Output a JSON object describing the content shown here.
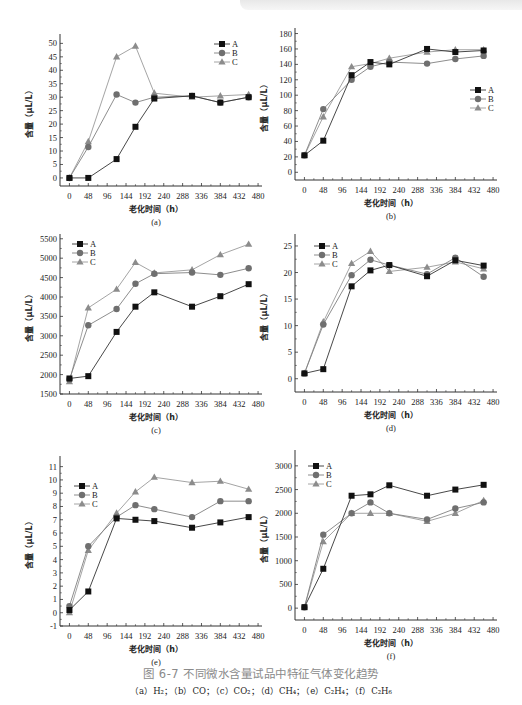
{
  "figure": {
    "title": "图 6-7   不同微水含量试品中特征气体变化趋势",
    "subtitle": "（a）H₂；（b）CO；（c）CO₂；（d）CH₄；（e）C₂H₄；（f）C₂H₆"
  },
  "style": {
    "series_colors": {
      "A": "#111111",
      "B": "#6f6f6f",
      "C": "#8c8c8c"
    },
    "line_colors": {
      "A": "#333333",
      "B": "#808080",
      "C": "#9a9a9a"
    },
    "markers": {
      "A": "square",
      "B": "circle",
      "C": "triangle"
    }
  },
  "chart_data": [
    {
      "id": "a",
      "panel_label": "(a)",
      "type": "line",
      "title": "",
      "xlabel": "老化时间（h）",
      "ylabel": "含量（μL/L）",
      "x": [
        0,
        48,
        120,
        168,
        216,
        312,
        384,
        456
      ],
      "xticks": [
        0,
        48,
        96,
        144,
        192,
        240,
        288,
        336,
        384,
        432,
        480
      ],
      "xlim": [
        -24,
        490
      ],
      "yticks": [
        0,
        5,
        10,
        15,
        20,
        25,
        30,
        35,
        40,
        45,
        50
      ],
      "ylim": [
        -3,
        52
      ],
      "legend_position": "upper-right",
      "series": [
        {
          "name": "A",
          "values": [
            0,
            0,
            7,
            19,
            29.5,
            30.5,
            28,
            30
          ]
        },
        {
          "name": "B",
          "values": [
            0,
            11.5,
            31,
            28,
            30,
            30.5,
            28,
            30
          ]
        },
        {
          "name": "C",
          "values": [
            0,
            13.5,
            45,
            49,
            31.5,
            30,
            30.5,
            31
          ]
        }
      ]
    },
    {
      "id": "b",
      "panel_label": "(b)",
      "type": "line",
      "title": "",
      "xlabel": "老化时间（h）",
      "ylabel": "含量（μL/L）",
      "x": [
        0,
        48,
        120,
        168,
        216,
        312,
        384,
        456
      ],
      "xticks": [
        0,
        48,
        96,
        144,
        192,
        240,
        288,
        336,
        384,
        432,
        480
      ],
      "xlim": [
        -24,
        490
      ],
      "yticks": [
        0,
        20,
        40,
        60,
        80,
        100,
        120,
        140,
        160,
        180
      ],
      "ylim": [
        -10,
        182
      ],
      "legend_position": "right",
      "series": [
        {
          "name": "A",
          "values": [
            22,
            41,
            126,
            143,
            140,
            160,
            156,
            158
          ]
        },
        {
          "name": "B",
          "values": [
            22,
            82,
            120,
            137,
            143,
            141,
            147,
            151
          ]
        },
        {
          "name": "C",
          "values": [
            22,
            72,
            137,
            141,
            148,
            156,
            159,
            159
          ]
        }
      ]
    },
    {
      "id": "c",
      "panel_label": "(c)",
      "type": "line",
      "title": "",
      "xlabel": "老化时间（h）",
      "ylabel": "含量（μL/L）",
      "x": [
        0,
        48,
        120,
        168,
        216,
        312,
        384,
        456
      ],
      "xticks": [
        0,
        48,
        96,
        144,
        192,
        240,
        288,
        336,
        384,
        432,
        480
      ],
      "xlim": [
        -24,
        490
      ],
      "yticks": [
        1500,
        2000,
        2500,
        3000,
        3500,
        4000,
        4500,
        5000,
        5500
      ],
      "ylim": [
        1500,
        5520
      ],
      "legend_position": "upper-left",
      "series": [
        {
          "name": "A",
          "values": [
            1900,
            1960,
            3100,
            3750,
            4120,
            3750,
            4020,
            4330
          ]
        },
        {
          "name": "B",
          "values": [
            1880,
            3270,
            3690,
            4340,
            4600,
            4630,
            4570,
            4740
          ]
        },
        {
          "name": "C",
          "values": [
            1820,
            3720,
            4200,
            4890,
            4620,
            4700,
            5090,
            5360
          ]
        }
      ]
    },
    {
      "id": "d",
      "panel_label": "(d)",
      "type": "line",
      "title": "",
      "xlabel": "老化时间（h）",
      "ylabel": "含量（μL/L）",
      "x": [
        0,
        48,
        120,
        168,
        216,
        312,
        384,
        456
      ],
      "xticks": [
        0,
        48,
        96,
        144,
        192,
        240,
        288,
        336,
        384,
        432,
        480
      ],
      "xlim": [
        -24,
        490
      ],
      "yticks": [
        0,
        5,
        10,
        15,
        20,
        25
      ],
      "ylim": [
        -2.5,
        26.5
      ],
      "legend_position": "upper-left",
      "series": [
        {
          "name": "A",
          "values": [
            1,
            1.8,
            17.4,
            20.4,
            21.4,
            19.3,
            22.3,
            21.3
          ]
        },
        {
          "name": "B",
          "values": [
            1,
            10.2,
            19.5,
            22.4,
            21.4,
            19.7,
            22.8,
            19.2
          ]
        },
        {
          "name": "C",
          "values": [
            1,
            10.7,
            21.7,
            24,
            20.2,
            21,
            22,
            20.7
          ]
        }
      ]
    },
    {
      "id": "e",
      "panel_label": "(e)",
      "type": "line",
      "title": "",
      "xlabel": "老化时间（h）",
      "ylabel": "含量（μL/L）",
      "x": [
        0,
        48,
        120,
        168,
        216,
        312,
        384,
        456
      ],
      "xticks": [
        0,
        48,
        96,
        144,
        192,
        240,
        288,
        336,
        384,
        432,
        480
      ],
      "xlim": [
        -24,
        490
      ],
      "yticks": [
        -1,
        0,
        1,
        2,
        3,
        4,
        5,
        6,
        7,
        8,
        9,
        10,
        11
      ],
      "ylim": [
        -1,
        11.5
      ],
      "legend_position": "upper-left",
      "series": [
        {
          "name": "A",
          "values": [
            0.2,
            1.6,
            7.1,
            7.0,
            6.9,
            6.4,
            6.8,
            7.2
          ]
        },
        {
          "name": "B",
          "values": [
            0.5,
            5.0,
            7.2,
            8.1,
            7.8,
            7.2,
            8.4,
            8.4
          ]
        },
        {
          "name": "C",
          "values": [
            0.0,
            4.7,
            7.5,
            9.1,
            10.2,
            9.8,
            9.9,
            9.3
          ]
        }
      ]
    },
    {
      "id": "f",
      "panel_label": "(f)",
      "type": "line",
      "title": "",
      "xlabel": "老化时间（h）",
      "ylabel": "含量（μL/L）",
      "x": [
        0,
        48,
        120,
        168,
        216,
        312,
        384,
        456
      ],
      "xticks": [
        0,
        48,
        96,
        144,
        192,
        240,
        288,
        336,
        384,
        432,
        480
      ],
      "xlim": [
        -24,
        490
      ],
      "yticks": [
        0,
        500,
        1000,
        1500,
        2000,
        2500,
        3000
      ],
      "ylim": [
        -250,
        3250
      ],
      "legend_position": "upper-left",
      "series": [
        {
          "name": "A",
          "values": [
            20,
            830,
            2370,
            2400,
            2590,
            2370,
            2500,
            2600
          ]
        },
        {
          "name": "B",
          "values": [
            20,
            1550,
            2000,
            2230,
            2000,
            1870,
            2100,
            2230
          ]
        },
        {
          "name": "C",
          "values": [
            20,
            1400,
            2000,
            2000,
            2000,
            1830,
            2000,
            2270
          ]
        }
      ]
    }
  ],
  "layout": [
    {
      "id": "a",
      "left": 22,
      "top": 30,
      "width": 250,
      "height": 205,
      "plot": {
        "x": 38,
        "y": 8,
        "w": 202,
        "h": 148
      },
      "legend": {
        "x": 192,
        "y": 14
      }
    },
    {
      "id": "b",
      "left": 262,
      "top": 26,
      "width": 260,
      "height": 205,
      "plot": {
        "x": 33,
        "y": 6,
        "w": 202,
        "h": 148
      },
      "legend": {
        "x": 208,
        "y": 64
      }
    },
    {
      "id": "c",
      "left": 22,
      "top": 230,
      "width": 250,
      "height": 205,
      "plot": {
        "x": 38,
        "y": 8,
        "w": 202,
        "h": 156
      },
      "legend": {
        "x": 50,
        "y": 14
      }
    },
    {
      "id": "d",
      "left": 262,
      "top": 230,
      "width": 260,
      "height": 205,
      "plot": {
        "x": 33,
        "y": 8,
        "w": 202,
        "h": 154
      },
      "legend": {
        "x": 52,
        "y": 16
      }
    },
    {
      "id": "e",
      "left": 22,
      "top": 452,
      "width": 250,
      "height": 205,
      "plot": {
        "x": 38,
        "y": 8,
        "w": 202,
        "h": 166
      },
      "legend": {
        "x": 52,
        "y": 34
      }
    },
    {
      "id": "f",
      "left": 262,
      "top": 446,
      "width": 260,
      "height": 205,
      "plot": {
        "x": 33,
        "y": 8,
        "w": 202,
        "h": 166
      },
      "legend": {
        "x": 46,
        "y": 20
      }
    }
  ]
}
